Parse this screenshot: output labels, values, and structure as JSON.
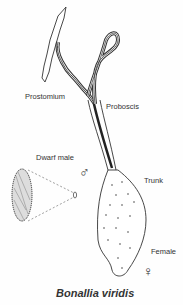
{
  "figure": {
    "caption": "Bonallia viridis",
    "labels": {
      "prostomium": "Prostomium",
      "proboscis": "Proboscis",
      "dwarf_male": "Dwarf male",
      "trunk": "Trunk",
      "female": "Female"
    },
    "symbols": {
      "male": "♂",
      "female": "♀"
    }
  }
}
